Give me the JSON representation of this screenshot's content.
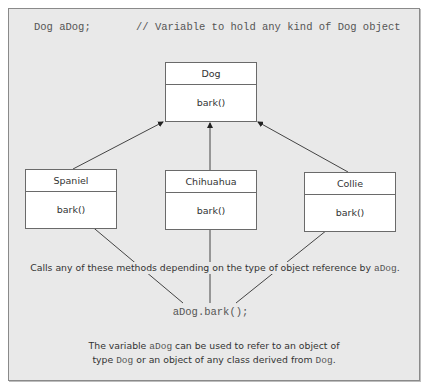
{
  "code": {
    "declaration": "Dog aDog;",
    "comment": "// Variable to hold any kind of Dog object",
    "call": "aDog.bark();"
  },
  "classes": {
    "base": {
      "name": "Dog",
      "method": "bark()"
    },
    "derived": [
      {
        "name": "Spaniel",
        "method": "bark()"
      },
      {
        "name": "Chihuahua",
        "method": "bark()"
      },
      {
        "name": "Collie",
        "method": "bark()"
      }
    ]
  },
  "annotations": {
    "calls_prefix": "Calls any of these methods depending on the type of object reference by ",
    "calls_var": "aDog",
    "calls_suffix": ".",
    "note_line1_prefix": "The variable ",
    "note_line1_var": "aDog",
    "note_line1_suffix": " can be used to refer to an object of",
    "note_line2_prefix": "type ",
    "note_line2_type1": "Dog",
    "note_line2_mid": " or an object of any class derived from ",
    "note_line2_type2": "Dog",
    "note_line2_suffix": "."
  },
  "colors": {
    "background": "#e9e9e9",
    "box_fill": "#ffffff",
    "line": "#444444"
  }
}
